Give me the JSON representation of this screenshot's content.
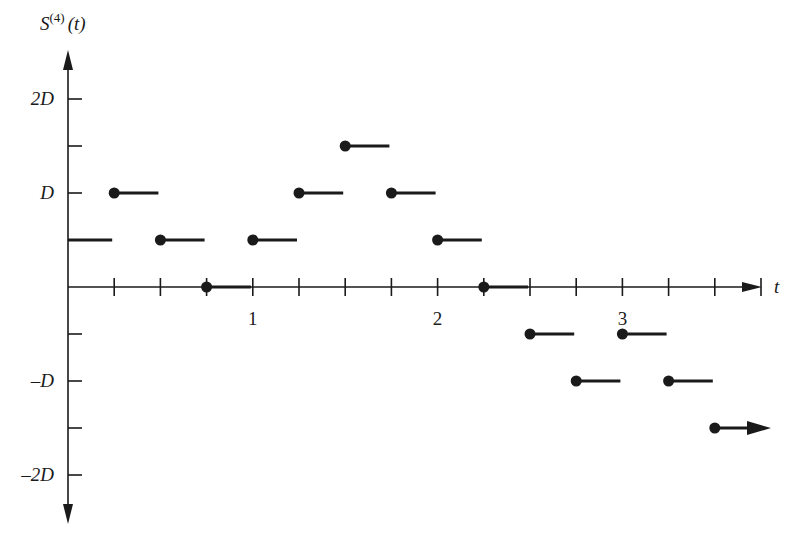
{
  "chart_data": {
    "type": "step",
    "title": "",
    "ylabel": "S^(4)(t)",
    "ylabel_base": "S",
    "ylabel_sup": "(4)",
    "ylabel_arg": "(t)",
    "xlabel": "t",
    "x_ticks_labeled": [
      {
        "value": 1,
        "label": "1"
      },
      {
        "value": 2,
        "label": "2"
      },
      {
        "value": 3,
        "label": "3"
      }
    ],
    "x_tick_step": 0.25,
    "y_ticks": [
      {
        "value": 2,
        "label": "2D"
      },
      {
        "value": 1.5,
        "label": ""
      },
      {
        "value": 1,
        "label": "D"
      },
      {
        "value": 0.5,
        "label": ""
      },
      {
        "value": -0.5,
        "label": ""
      },
      {
        "value": -1,
        "label": "–D"
      },
      {
        "value": -1.5,
        "label": ""
      },
      {
        "value": -2,
        "label": "–2D"
      }
    ],
    "y_unit": "D",
    "xlim": [
      0,
      3.75
    ],
    "ylim": [
      -2.5,
      2.5
    ],
    "segments": [
      {
        "t_start": 0.0,
        "t_end": 0.25,
        "value": 0.5,
        "start_dot": false
      },
      {
        "t_start": 0.25,
        "t_end": 0.5,
        "value": 1.0,
        "start_dot": true
      },
      {
        "t_start": 0.5,
        "t_end": 0.75,
        "value": 0.5,
        "start_dot": true
      },
      {
        "t_start": 0.75,
        "t_end": 1.0,
        "value": 0.0,
        "start_dot": true
      },
      {
        "t_start": 1.0,
        "t_end": 1.25,
        "value": 0.5,
        "start_dot": true
      },
      {
        "t_start": 1.25,
        "t_end": 1.5,
        "value": 1.0,
        "start_dot": true
      },
      {
        "t_start": 1.5,
        "t_end": 1.75,
        "value": 1.5,
        "start_dot": true
      },
      {
        "t_start": 1.75,
        "t_end": 2.0,
        "value": 1.0,
        "start_dot": true
      },
      {
        "t_start": 2.0,
        "t_end": 2.25,
        "value": 0.5,
        "start_dot": true
      },
      {
        "t_start": 2.25,
        "t_end": 2.5,
        "value": 0.0,
        "start_dot": true
      },
      {
        "t_start": 2.5,
        "t_end": 2.75,
        "value": -0.5,
        "start_dot": true
      },
      {
        "t_start": 2.75,
        "t_end": 3.0,
        "value": -1.0,
        "start_dot": true
      },
      {
        "t_start": 3.0,
        "t_end": 3.25,
        "value": -0.5,
        "start_dot": true
      },
      {
        "t_start": 3.25,
        "t_end": 3.5,
        "value": -1.0,
        "start_dot": true
      },
      {
        "t_start": 3.5,
        "t_end": 3.75,
        "value": -1.5,
        "start_dot": true,
        "arrow": true
      }
    ],
    "grid": false,
    "legend": null
  },
  "layout": {
    "origin_x": 68,
    "origin_y": 287,
    "px_per_t": 184.8,
    "px_per_D": 94,
    "x_axis_end": 762,
    "y_axis_top": 50,
    "y_axis_bottom": 524,
    "ink": "#1a1a1a"
  }
}
